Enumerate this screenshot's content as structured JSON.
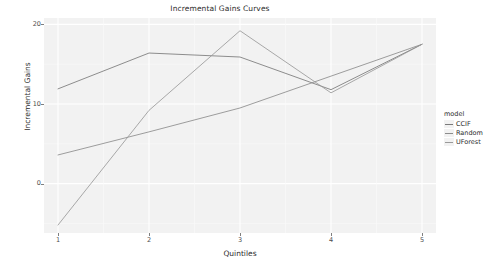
{
  "chart_data": {
    "type": "line",
    "title": "Incremental Gains Curves",
    "xlabel": "Quintiles",
    "ylabel": "Incremental Gains",
    "x": [
      1,
      2,
      3,
      4,
      5
    ],
    "xticklabels": [
      "1",
      "2",
      "3",
      "4",
      "5"
    ],
    "yticklabels": [
      "0",
      "10",
      "20"
    ],
    "yticks": [
      0,
      10,
      20
    ],
    "xlim": [
      1,
      5
    ],
    "ylim": [
      -6.2,
      20.8
    ],
    "grid": true,
    "legend_position": "right",
    "legend_title": "model",
    "series": [
      {
        "name": "CCIF",
        "color": "#7a7a7a",
        "values": [
          11.9,
          16.4,
          15.9,
          11.8,
          17.5
        ]
      },
      {
        "name": "Random",
        "color": "#8c8c8c",
        "values": [
          3.6,
          6.5,
          9.5,
          13.5,
          17.5
        ]
      },
      {
        "name": "UForest",
        "color": "#9a9a9a",
        "values": [
          -5.2,
          9.2,
          19.2,
          11.4,
          17.5
        ]
      }
    ]
  },
  "legend": {
    "title": "model",
    "items": [
      {
        "label": "CCIF"
      },
      {
        "label": "Random"
      },
      {
        "label": "UForest"
      }
    ]
  },
  "axes": {
    "y_ticks": [
      {
        "label": "20",
        "value": 20
      },
      {
        "label": "10",
        "value": 10
      },
      {
        "label": "0",
        "value": 0
      }
    ],
    "x_ticks": [
      {
        "label": "1",
        "value": 1
      },
      {
        "label": "2",
        "value": 2
      },
      {
        "label": "3",
        "value": 3
      },
      {
        "label": "4",
        "value": 4
      },
      {
        "label": "5",
        "value": 5
      }
    ]
  },
  "style": {
    "panel_background": "#f2f2f2",
    "grid_major": "#ffffff",
    "grid_minor": "#fafafa",
    "text_color": "#2b2b2b"
  }
}
